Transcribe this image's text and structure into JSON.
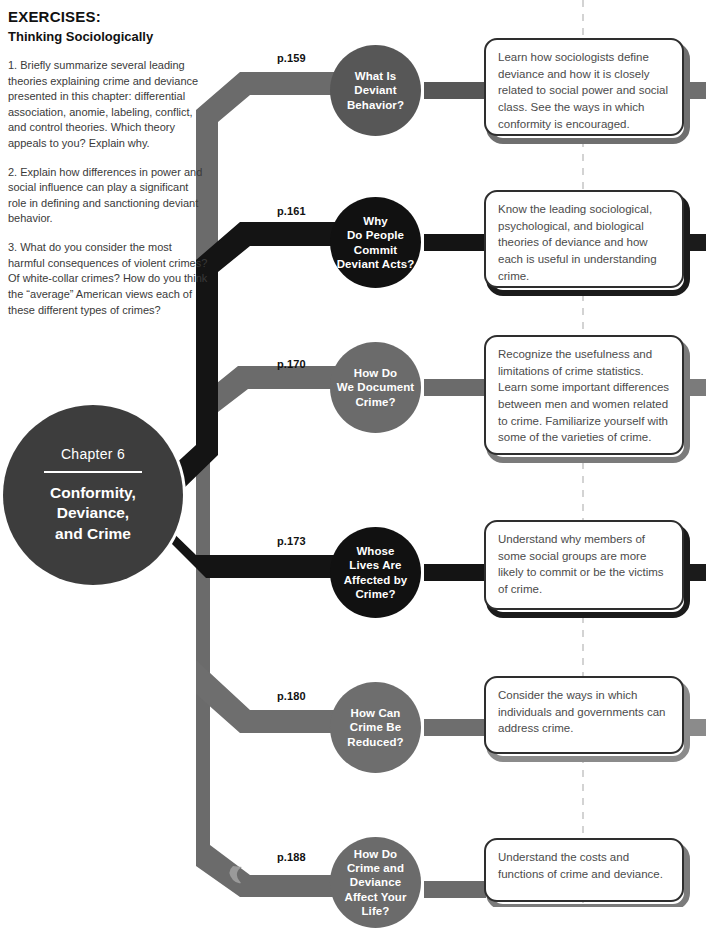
{
  "exercises": {
    "title": "EXERCISES:",
    "subtitle": "Thinking Sociologically",
    "items": [
      "1. Briefly summarize several leading theories explaining crime and deviance presented in this chapter: differential association, anomie, labeling, conflict, and control theories. Which theory appeals to you? Explain why.",
      "2. Explain how differences in power and social influence can play a significant role in defining and sanctioning deviant behavior.",
      "3. What do you consider the most harmful consequences of violent crimes? Of white-collar crimes? How do you think the “average” American views each of these different types of crimes?"
    ]
  },
  "chapter": {
    "number_label": "Chapter 6",
    "title": "Conformity,\nDeviance,\nand Crime",
    "color": "#3d3d3d"
  },
  "colors": {
    "dark": "#1b1b1b",
    "mid_dark": "#575757",
    "mid": "#6b6b6b",
    "light": "#7a7a7a",
    "dashed_line": "#c9c9c9",
    "box_text": "#4b4b4b",
    "page_text": "#111111"
  },
  "dashed_divider": {
    "x": 583,
    "visible": true
  },
  "nodes": [
    {
      "page": "p.159",
      "question": "What Is\nDeviant\nBehavior?",
      "outcome": "Learn how sociologists define deviance and how it is closely related to social power and social class. See the ways in which conformity is encouraged.",
      "color": "#575757",
      "box_border": "#6f6f6f"
    },
    {
      "page": "p.161",
      "question": "Why\nDo People\nCommit\nDeviant Acts?",
      "outcome": "Know the leading sociological, psychological, and biological theories of deviance and how each is useful in understanding crime.",
      "color": "#111111",
      "box_border": "#1b1b1b"
    },
    {
      "page": "p.170",
      "question": "How Do\nWe Document\nCrime?",
      "outcome": "Recognize the usefulness and limitations of crime statistics. Learn some important differences between men and women related to crime. Familiarize yourself with some of the varieties of crime.",
      "color": "#6b6b6b",
      "box_border": "#7b7b7b"
    },
    {
      "page": "p.173",
      "question": "Whose\nLives Are\nAffected by\nCrime?",
      "outcome": "Understand why members of some social groups are more likely to commit or be the victims of crime.",
      "color": "#111111",
      "box_border": "#1b1b1b"
    },
    {
      "page": "p.180",
      "question": "How Can\nCrime Be\nReduced?",
      "outcome": "Consider the ways in which individuals and governments can address crime.",
      "color": "#6e6e6e",
      "box_border": "#8b8b8b"
    },
    {
      "page": "p.188",
      "question": "How Do\nCrime and\nDeviance\nAffect Your\nLife?",
      "outcome": "Understand the costs and functions of crime and deviance.",
      "color": "#6b6b6b",
      "box_border": "#7b7b7b"
    }
  ]
}
